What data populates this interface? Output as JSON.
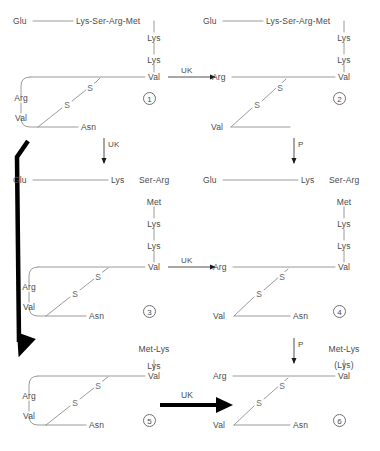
{
  "figure": {
    "type": "biochemical-pathway-diagram",
    "residue_labels": {
      "glu": "Glu",
      "lys": "Lys",
      "ser": "Ser",
      "arg": "Arg",
      "met": "Met",
      "val": "Val",
      "asn": "Asn",
      "sulfur": "S",
      "lys_ser_arg_met": "Lys-Ser-Arg-Met",
      "ser_arg": "Ser-Arg",
      "met_lys": "Met-Lys",
      "lys_paren": "(Lys)"
    },
    "enzymes": {
      "uk": "UK",
      "p": "P"
    },
    "colors": {
      "line": "#8a8a8a",
      "text": "#4a4a4a",
      "bold_arrow": "#000000",
      "background": "#ffffff"
    }
  },
  "panels": [
    {
      "id": "panel-1",
      "number": "1",
      "position": "top-left",
      "chain_top": [
        "Glu",
        "Lys-Ser-Arg-Met"
      ],
      "side_chain": [
        "Lys",
        "Lys",
        "Val"
      ],
      "loop_residues": [
        "Arg",
        "Val",
        "Asn"
      ],
      "disulfides": [
        "S",
        "S"
      ]
    },
    {
      "id": "panel-2",
      "number": "2",
      "position": "top-right",
      "chain_top": [
        "Glu",
        "Lys-Ser-Arg-Met"
      ],
      "side_chain": [
        "Lys",
        "Lys",
        "Val"
      ],
      "loop_residues": [
        "Arg",
        "Val"
      ],
      "disulfides": [
        "S",
        "S"
      ]
    },
    {
      "id": "panel-3",
      "number": "3",
      "position": "middle-left",
      "chain_top": [
        "Glu",
        "Lys",
        "Ser-Arg"
      ],
      "side_chain": [
        "Met",
        "Lys",
        "Lys",
        "Val"
      ],
      "loop_residues": [
        "Arg",
        "Val",
        "Asn"
      ],
      "disulfides": [
        "S",
        "S"
      ]
    },
    {
      "id": "panel-4",
      "number": "4",
      "position": "middle-right",
      "chain_top": [
        "Glu",
        "Lys",
        "Ser-Arg"
      ],
      "side_chain": [
        "Met",
        "Lys",
        "Lys",
        "Val"
      ],
      "loop_residues": [
        "Arg",
        "Val",
        "Asn"
      ],
      "disulfides": [
        "S",
        "S"
      ]
    },
    {
      "id": "panel-5",
      "number": "5",
      "position": "bottom-left",
      "chain_top": [
        "Met-Lys"
      ],
      "side_chain": [
        "Lys",
        "Val"
      ],
      "loop_residues": [
        "Arg",
        "Val",
        "Asn"
      ],
      "disulfides": [
        "S",
        "S"
      ]
    },
    {
      "id": "panel-6",
      "number": "6",
      "position": "bottom-right",
      "chain_top": [
        "Met-Lys"
      ],
      "side_chain": [
        "(Lys)",
        "Val"
      ],
      "loop_residues": [
        "Arg",
        "Val",
        "Asn"
      ],
      "disulfides": [
        "S",
        "S"
      ]
    }
  ],
  "reactions": [
    {
      "id": "rxn-1-to-2",
      "label": "UK",
      "from": "1",
      "to": "2",
      "style": "thin-horizontal"
    },
    {
      "id": "rxn-1-to-3",
      "label": "UK",
      "from": "1",
      "to": "3",
      "style": "thin-vertical"
    },
    {
      "id": "rxn-2-to-4",
      "label": "P",
      "from": "2",
      "to": "4",
      "style": "thin-vertical"
    },
    {
      "id": "rxn-3-to-4",
      "label": "UK",
      "from": "3",
      "to": "4",
      "style": "thin-horizontal"
    },
    {
      "id": "rxn-4-to-6",
      "label": "P",
      "from": "4",
      "to": "6",
      "style": "thin-vertical"
    },
    {
      "id": "rxn-5-to-6",
      "label": "UK",
      "from": "5",
      "to": "6",
      "style": "bold-horizontal"
    },
    {
      "id": "rxn-1-to-5",
      "label": "",
      "from": "1",
      "to": "5",
      "style": "bold-bent"
    }
  ]
}
